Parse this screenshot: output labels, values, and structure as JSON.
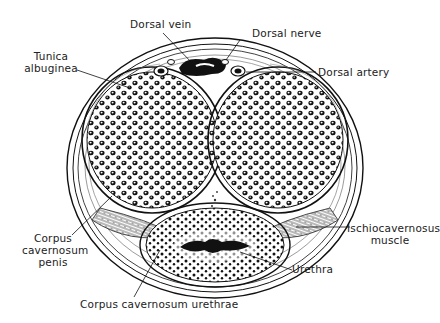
{
  "figure": {
    "type": "anatomical cross-section",
    "labels": {
      "dorsal_vein": "Dorsal vein",
      "dorsal_nerve": "Dorsal nerve",
      "dorsal_artery": "Dorsal artery",
      "tunica_albuginea_1": "Tunica",
      "tunica_albuginea_2": "albuginea",
      "corpus_cavernosum_penis_1": "Corpus",
      "corpus_cavernosum_penis_2": "cavernosum",
      "corpus_cavernosum_penis_3": "penis",
      "ischiocavernosus_1": "Ischiocavernosus",
      "ischiocavernosus_2": "muscle",
      "urethra": "Urethra",
      "corpus_cavernosum_urethrae": "Corpus cavernosum urethrae"
    },
    "colors": {
      "ink": "#111111",
      "background": "#ffffff"
    }
  }
}
